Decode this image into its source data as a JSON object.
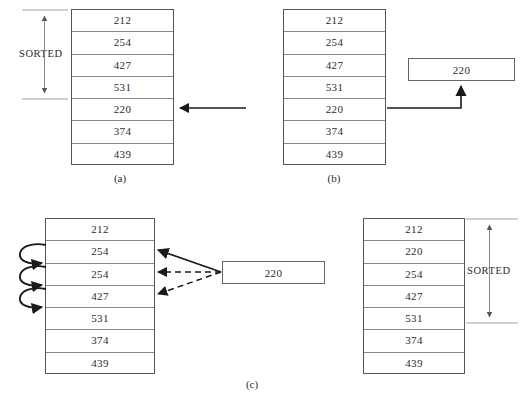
{
  "figure": {
    "caption_a": "(a)",
    "caption_b": "(b)",
    "caption_c": "(c)",
    "sorted_label": "SORTED"
  },
  "panels": {
    "a": {
      "id": "a",
      "caption": "(a)",
      "sorted_label": "SORTED",
      "cells": [
        "212",
        "254",
        "427",
        "531",
        "220",
        "374",
        "439"
      ],
      "marker_row_index": 4,
      "marker_row_value": "220"
    },
    "b": {
      "id": "b",
      "caption": "(b)",
      "cells": [
        "212",
        "254",
        "427",
        "531",
        "220",
        "374",
        "439"
      ],
      "temp_value": "220",
      "source_row_index": 4
    },
    "c": {
      "id": "c",
      "caption": "(c)",
      "cells": [
        "212",
        "254",
        "254",
        "427",
        "531",
        "374",
        "439"
      ],
      "temp_value": "220",
      "shift_arrow_count": 3,
      "compare_rows": [
        "254",
        "254",
        "427"
      ]
    },
    "d": {
      "id": "d",
      "caption": "",
      "sorted_label": "SORTED",
      "cells": [
        "212",
        "220",
        "254",
        "427",
        "531",
        "374",
        "439"
      ],
      "sorted_through_index": 4
    }
  },
  "colors": {
    "border": "#555555",
    "cell_divider": "#888888",
    "text": "#2b2b2b",
    "arrow": "#1a1a1a",
    "bracket": "#777777",
    "background": "#ffffff"
  }
}
